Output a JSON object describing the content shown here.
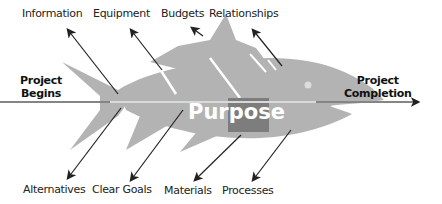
{
  "diagram": {
    "type": "fishbone",
    "center_label": "Purpose",
    "start_label": [
      "Project",
      "Begins"
    ],
    "end_label": [
      "Project",
      "Completion"
    ],
    "top_causes": [
      "Information",
      "Equipment",
      "Budgets",
      "Relationships"
    ],
    "bottom_causes": [
      "Alternatives",
      "Clear Goals",
      "Materials",
      "Processes"
    ],
    "colors": {
      "fish_body": "#b3b3b3",
      "fish_highlight": "#d6d6d6",
      "purpose_box": "#7a7a7a",
      "arrows": "#222222",
      "text": "#222222"
    }
  }
}
